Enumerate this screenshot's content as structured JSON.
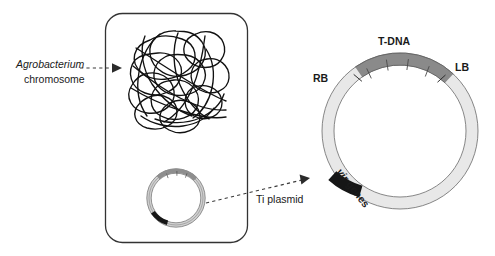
{
  "figure": {
    "background_color": "#ffffff"
  },
  "colors": {
    "outline": "#333333",
    "text": "#1a1a1a",
    "ring_light": "#e8e8e8",
    "ring_tdna_gray": "#8a8a8a",
    "ring_vir_black": "#161616",
    "ring_stroke": "#555555",
    "chromosome": "#111111",
    "arrow": "#3a3a3a"
  },
  "cell": {
    "name": "agrobacterium-cell",
    "shape": "rounded-rectangle"
  },
  "labels": {
    "chromosome_line1": "Agrobacterium",
    "chromosome_line2": "chromosome",
    "ti_plasmid": "Ti plasmid",
    "t_dna": "T-DNA",
    "rb": "RB",
    "lb": "LB",
    "vir_italic": "vir",
    "vir_rest": " genes"
  },
  "plasmid_map": {
    "type": "circular-map",
    "regions": [
      {
        "name": "T-DNA",
        "color": "#8a8a8a",
        "start_deg": -125,
        "end_deg": -47,
        "segments": 5
      },
      {
        "name": "vir genes",
        "color": "#161616",
        "start_deg": 123,
        "end_deg": 160
      },
      {
        "name": "backbone",
        "color": "#e8e8e8"
      }
    ],
    "borders": [
      {
        "name": "RB",
        "position_deg": -125
      },
      {
        "name": "LB",
        "position_deg": -47
      }
    ]
  },
  "small_plasmid": {
    "name": "ti-plasmid-small",
    "regions": [
      {
        "name": "T-DNA",
        "color": "#8a8a8a"
      },
      {
        "name": "vir genes",
        "color": "#161616"
      },
      {
        "name": "backbone",
        "color": "#d8d8d8"
      }
    ]
  },
  "connectors": [
    {
      "name": "chromosome-pointer",
      "style": "dashed-arrow"
    },
    {
      "name": "ti-plasmid-pointer",
      "style": "dashed-arrow"
    }
  ]
}
